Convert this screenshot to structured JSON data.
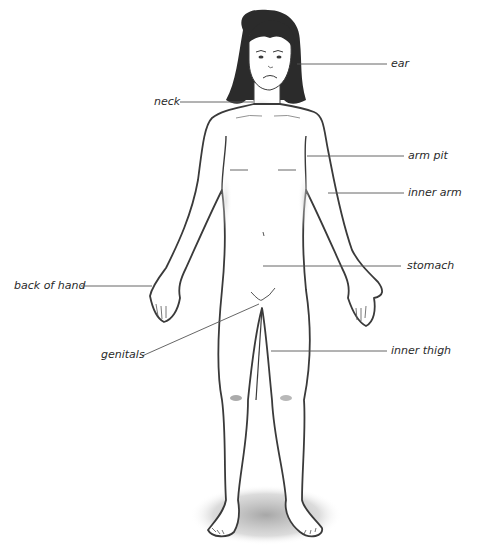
{
  "diagram": {
    "title": "",
    "type": "labeled body diagram",
    "labels": [
      {
        "id": "ear",
        "text": "ear",
        "x": 391,
        "y": 58
      },
      {
        "id": "neck",
        "text": "neck",
        "x": 154,
        "y": 97
      },
      {
        "id": "arm-pit",
        "text": "arm pit",
        "x": 408,
        "y": 150
      },
      {
        "id": "inner-arm",
        "text": "inner arm",
        "x": 408,
        "y": 187
      },
      {
        "id": "stomach",
        "text": "stomach",
        "x": 407,
        "y": 260
      },
      {
        "id": "back-of-hand",
        "text": "back of hand",
        "x": 14,
        "y": 280
      },
      {
        "id": "genitals",
        "text": "genitals",
        "x": 101,
        "y": 349
      },
      {
        "id": "inner-thigh",
        "text": "inner thigh",
        "x": 391,
        "y": 346
      }
    ],
    "colors": {
      "line": "#555555",
      "outline": "#3a3a3a",
      "hair": "#2b2b2b",
      "shadow": "#9a9a9a",
      "text": "#2a2a2a"
    }
  }
}
